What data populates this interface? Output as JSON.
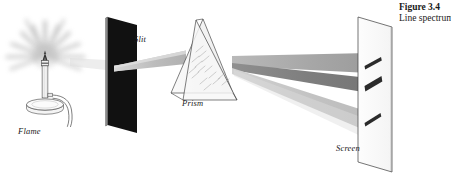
{
  "figure": {
    "caption_title": "Figure 3.4",
    "caption_desc": "Line spectrum",
    "background_color": "#ffffff"
  },
  "labels": {
    "flame": "Flame",
    "slit": "Slit",
    "prism": "Prism",
    "screen": "Screen"
  },
  "colors": {
    "outline": "#3a3a3a",
    "slit_card": "#111111",
    "glow": "#b4b4b4",
    "beam_light": "#c9c9c9",
    "beam_mid": "#a8a8a8",
    "beam_dark": "#868686",
    "spectral_line": "#2b2b2b",
    "prism_face": "#f2f2f2",
    "text": "#1a1a1a"
  },
  "scene": {
    "source_label": "flame",
    "spectral_line_count": 3,
    "beam_count": 3,
    "glow_ray_count": 12
  }
}
